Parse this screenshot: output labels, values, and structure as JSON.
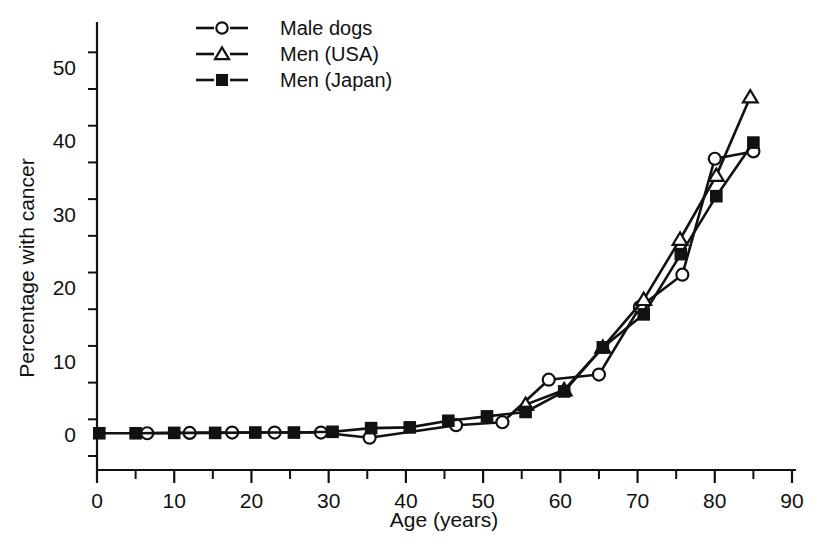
{
  "chart_data": {
    "type": "line",
    "title": "",
    "xlabel": "Age (years)",
    "ylabel": "Percentage with cancer",
    "xlim": [
      0,
      90
    ],
    "ylim": [
      -3,
      55
    ],
    "xticks": [
      0,
      10,
      20,
      30,
      40,
      50,
      60,
      70,
      80,
      90
    ],
    "yticks": [
      0,
      10,
      20,
      30,
      40,
      50
    ],
    "xtick_labels": [
      "0",
      "10",
      "20",
      "30",
      "40",
      "50",
      "60",
      "70",
      "80",
      "90"
    ],
    "ytick_labels": [
      "0",
      "10",
      "20",
      "30",
      "40",
      "50"
    ],
    "x_minor_step": 5,
    "y_minor_step": 5,
    "grid": false,
    "legend_position": "top-center",
    "series": [
      {
        "name": "Male dogs",
        "marker": "open-circle",
        "x": [
          6.5,
          12.0,
          17.5,
          23.0,
          29.0,
          35.3,
          46.5,
          52.5,
          58.5,
          65.0,
          70.3,
          75.8,
          80.0,
          85.0
        ],
        "y": [
          0.1,
          0.15,
          0.2,
          0.2,
          0.2,
          -0.5,
          1.2,
          1.6,
          7.4,
          8.1,
          17.3,
          21.7,
          37.5,
          38.5
        ]
      },
      {
        "name": "Men (USA)",
        "marker": "open-triangle",
        "x": [
          55.5,
          60.5,
          65.5,
          70.8,
          75.5,
          80.2,
          84.6
        ],
        "y": [
          4.0,
          6.0,
          11.8,
          18.3,
          26.5,
          35.2,
          45.9
        ]
      },
      {
        "name": "Men (Japan)",
        "marker": "filled-square",
        "x": [
          0.3,
          5.0,
          10.0,
          15.3,
          20.5,
          25.5,
          30.5,
          35.5,
          40.5,
          45.5,
          50.5,
          55.5,
          60.5,
          65.5,
          70.8,
          75.6,
          80.2,
          85.0
        ],
        "y": [
          0.1,
          0.1,
          0.15,
          0.15,
          0.2,
          0.2,
          0.3,
          0.8,
          0.9,
          1.8,
          2.4,
          3.0,
          5.8,
          11.8,
          16.3,
          24.5,
          32.4,
          39.7
        ]
      }
    ],
    "legend": [
      {
        "label": "Male dogs",
        "marker": "open-circle"
      },
      {
        "label": "Men (USA)",
        "marker": "open-triangle"
      },
      {
        "label": "Men (Japan)",
        "marker": "filled-square"
      }
    ]
  },
  "plot_geometry": {
    "x0_px": 97,
    "x1_px": 792,
    "y_zero_px": 434,
    "y_fifty_px": 67,
    "axis_top_px": 22,
    "axis_bottom_px": 470,
    "legend_x_px": 196,
    "legend_y_px": 28,
    "legend_row_h_px": 26
  }
}
